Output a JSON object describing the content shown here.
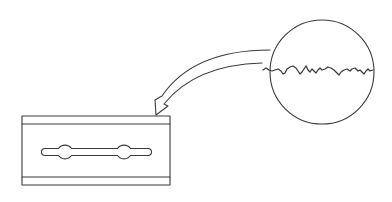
{
  "diagram": {
    "title": "",
    "stroke_color": "#3a3a3a",
    "background": "#ffffff",
    "elements": [
      {
        "id": "razor-blade",
        "label": ""
      },
      {
        "id": "magnifier-circle",
        "label": ""
      },
      {
        "id": "curved-arrow",
        "label": ""
      }
    ]
  }
}
